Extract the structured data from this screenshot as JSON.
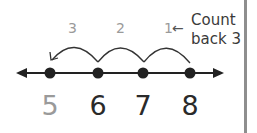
{
  "diagram": {
    "type": "number-line-count-back",
    "caption": {
      "line1": "Count",
      "line2": "back 3",
      "arrow": "←"
    },
    "jump_labels": [
      "3",
      "2",
      "1"
    ],
    "numbers": [
      "5",
      "6",
      "7",
      "8"
    ],
    "start": "8",
    "end": "5",
    "colors": {
      "line": "#222222",
      "dot": "#222222",
      "faded": "#9a9a9a",
      "bar": "#8e8e8e"
    }
  }
}
